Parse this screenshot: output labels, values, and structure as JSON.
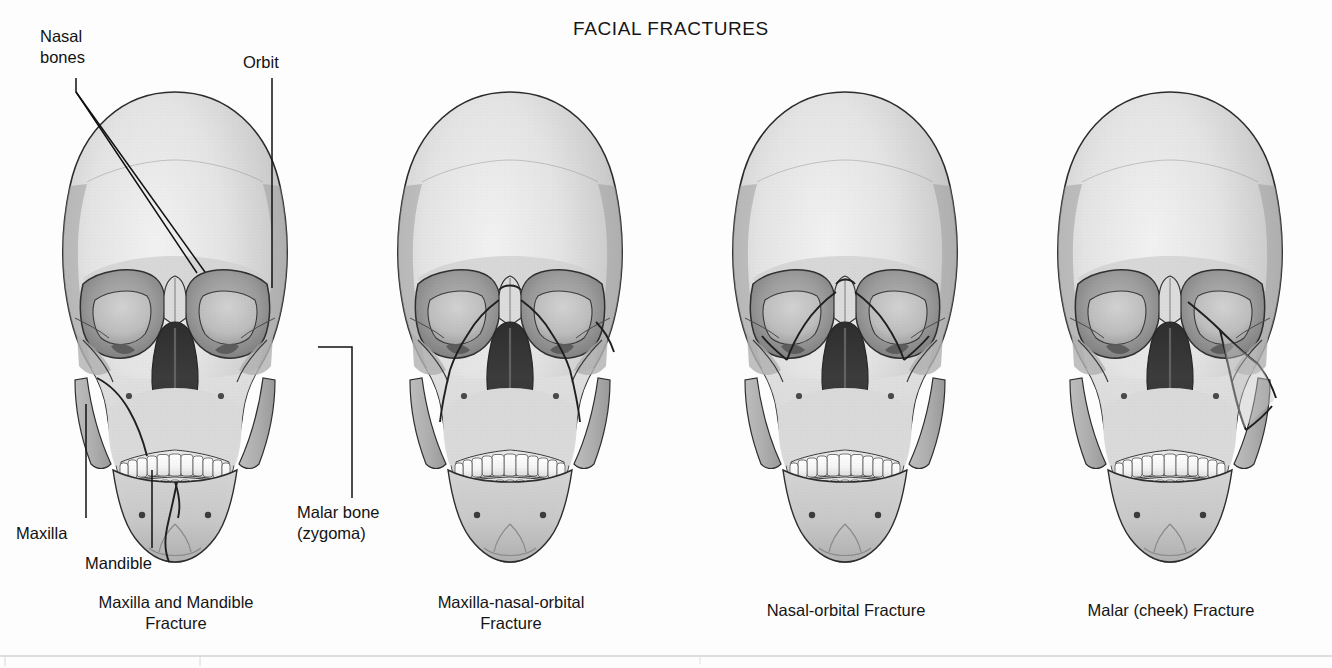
{
  "figure": {
    "title": "FACIAL FRACTURES",
    "background_color": "#fdfdfd",
    "text_color": "#161616"
  },
  "annotations": [
    {
      "id": "nasal-bones",
      "text": "Nasal\nbones"
    },
    {
      "id": "orbit",
      "text": "Orbit"
    },
    {
      "id": "maxilla",
      "text": "Maxilla"
    },
    {
      "id": "mandible",
      "text": "Mandible"
    },
    {
      "id": "malar-bone",
      "text": "Malar bone\n(zygoma)"
    }
  ],
  "panels": [
    {
      "id": "panel-1",
      "caption": "Maxilla and Mandible\nFracture",
      "fracture": "maxilla-mandible"
    },
    {
      "id": "panel-2",
      "caption": "Maxilla-nasal-orbital\nFracture",
      "fracture": "maxilla-nasal-orbital"
    },
    {
      "id": "panel-3",
      "caption": "Nasal-orbital Fracture",
      "fracture": "nasal-orbital"
    },
    {
      "id": "panel-4",
      "caption": "Malar (cheek) Fracture",
      "fracture": "malar"
    }
  ],
  "palette": {
    "bone_light": "#e9e9e9",
    "bone_mid": "#cfcfcf",
    "bone_shadow": "#a9a9a9",
    "orbit_interior": "#9a9a9a",
    "nasal_cavity": "#3b3b3b",
    "teeth": "#f7f7f7",
    "outline": "#2a2a2a",
    "leader_line": "#111111"
  }
}
